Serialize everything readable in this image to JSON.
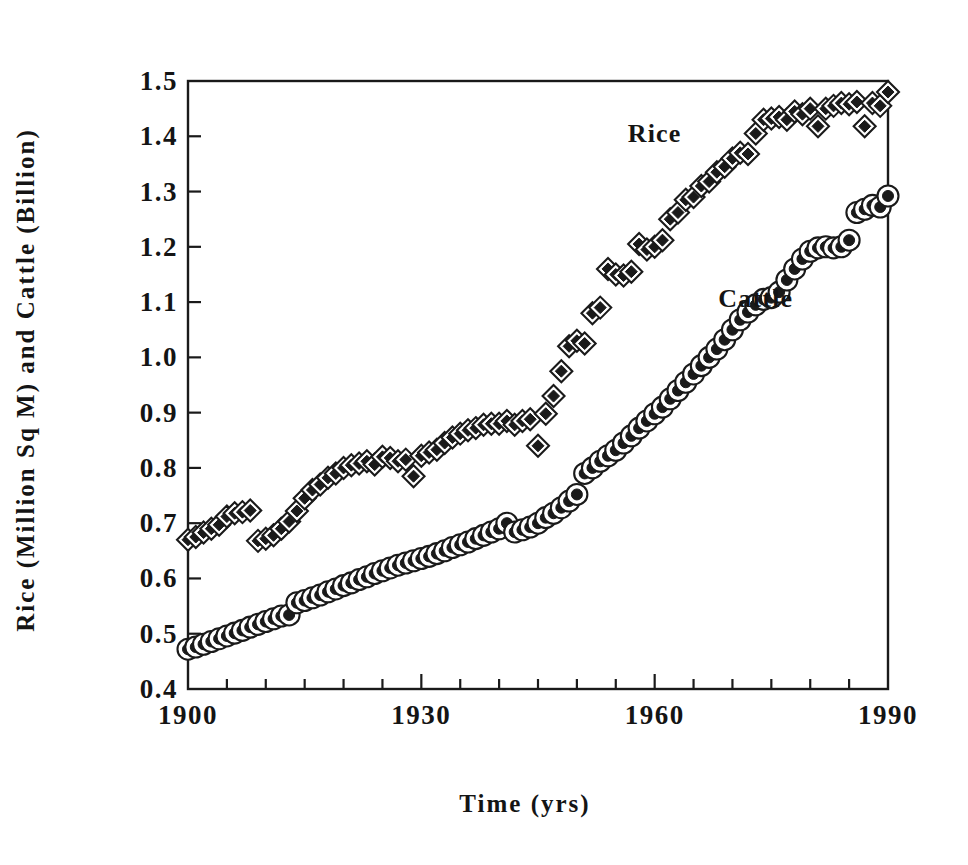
{
  "chart_data": {
    "type": "scatter",
    "title": "",
    "xlabel": "Time (yrs)",
    "ylabel": "Rice (Million Sq M) and Cattle (Billion)",
    "xlim": [
      1900,
      1990
    ],
    "ylim": [
      0.4,
      1.5
    ],
    "xticks": [
      1900,
      1930,
      1960,
      1990
    ],
    "xtick_labels": [
      "1900",
      "1930",
      "1960",
      "1990"
    ],
    "xminor_step": 5,
    "yticks": [
      0.4,
      0.5,
      0.6,
      0.7,
      0.8,
      0.9,
      1.0,
      1.1,
      1.2,
      1.3,
      1.4,
      1.5
    ],
    "ytick_labels": [
      "0.4",
      "0.5",
      "0.6",
      "0.7",
      "0.8",
      "0.9",
      "1.0",
      "1.1",
      "1.2",
      "1.3",
      "1.4",
      "1.5"
    ],
    "grid": false,
    "legend_position": "inline-annotation",
    "frame_color": "#1a1a1a",
    "marker_color": "#1a1a1a",
    "series": [
      {
        "name": "Rice",
        "marker": "diamond",
        "annotation_label": "Rice",
        "annotation_x": 1960,
        "annotation_y": 1.405,
        "x": [
          1900,
          1901,
          1902,
          1903,
          1904,
          1905,
          1906,
          1907,
          1908,
          1909,
          1910,
          1911,
          1912,
          1913,
          1914,
          1915,
          1916,
          1917,
          1918,
          1919,
          1920,
          1921,
          1922,
          1923,
          1924,
          1925,
          1926,
          1927,
          1928,
          1929,
          1930,
          1931,
          1932,
          1933,
          1934,
          1935,
          1936,
          1937,
          1938,
          1939,
          1940,
          1941,
          1942,
          1943,
          1944,
          1945,
          1946,
          1947,
          1948,
          1949,
          1950,
          1951,
          1952,
          1953,
          1954,
          1955,
          1956,
          1957,
          1958,
          1959,
          1960,
          1961,
          1962,
          1963,
          1964,
          1965,
          1966,
          1967,
          1968,
          1969,
          1970,
          1971,
          1972,
          1973,
          1974,
          1975,
          1976,
          1977,
          1978,
          1979,
          1980,
          1981,
          1982,
          1983,
          1984,
          1985,
          1986,
          1987,
          1988,
          1989,
          1990
        ],
        "y": [
          0.67,
          0.675,
          0.683,
          0.69,
          0.697,
          0.712,
          0.718,
          0.72,
          0.723,
          0.668,
          0.672,
          0.678,
          0.69,
          0.703,
          0.722,
          0.745,
          0.76,
          0.77,
          0.782,
          0.79,
          0.8,
          0.805,
          0.808,
          0.812,
          0.806,
          0.82,
          0.818,
          0.812,
          0.815,
          0.785,
          0.822,
          0.828,
          0.833,
          0.845,
          0.855,
          0.862,
          0.868,
          0.872,
          0.878,
          0.88,
          0.88,
          0.885,
          0.878,
          0.885,
          0.888,
          0.84,
          0.898,
          0.93,
          0.975,
          1.02,
          1.03,
          1.025,
          1.08,
          1.09,
          1.16,
          1.15,
          1.148,
          1.155,
          1.205,
          1.195,
          1.2,
          1.212,
          1.25,
          1.262,
          1.285,
          1.29,
          1.31,
          1.318,
          1.335,
          1.345,
          1.36,
          1.37,
          1.368,
          1.405,
          1.43,
          1.432,
          1.435,
          1.43,
          1.445,
          1.44,
          1.45,
          1.418,
          1.45,
          1.455,
          1.46,
          1.458,
          1.462,
          1.418,
          1.46,
          1.455,
          1.48
        ]
      },
      {
        "name": "Cattle",
        "marker": "circle",
        "annotation_label": "Cattle",
        "annotation_x": 1973,
        "annotation_y": 1.105,
        "x": [
          1900,
          1901,
          1902,
          1903,
          1904,
          1905,
          1906,
          1907,
          1908,
          1909,
          1910,
          1911,
          1912,
          1913,
          1914,
          1915,
          1916,
          1917,
          1918,
          1919,
          1920,
          1921,
          1922,
          1923,
          1924,
          1925,
          1926,
          1927,
          1928,
          1929,
          1930,
          1931,
          1932,
          1933,
          1934,
          1935,
          1936,
          1937,
          1938,
          1939,
          1940,
          1941,
          1942,
          1943,
          1944,
          1945,
          1946,
          1947,
          1948,
          1949,
          1950,
          1951,
          1952,
          1953,
          1954,
          1955,
          1956,
          1957,
          1958,
          1959,
          1960,
          1961,
          1962,
          1963,
          1964,
          1965,
          1966,
          1967,
          1968,
          1969,
          1970,
          1971,
          1972,
          1973,
          1974,
          1975,
          1976,
          1977,
          1978,
          1979,
          1980,
          1981,
          1982,
          1983,
          1984,
          1985,
          1986,
          1987,
          1988,
          1989,
          1990
        ],
        "y": [
          0.472,
          0.476,
          0.481,
          0.486,
          0.491,
          0.496,
          0.501,
          0.506,
          0.512,
          0.517,
          0.522,
          0.527,
          0.532,
          0.534,
          0.556,
          0.56,
          0.565,
          0.57,
          0.576,
          0.581,
          0.587,
          0.592,
          0.598,
          0.603,
          0.609,
          0.614,
          0.619,
          0.624,
          0.628,
          0.632,
          0.636,
          0.64,
          0.645,
          0.65,
          0.656,
          0.661,
          0.666,
          0.672,
          0.678,
          0.684,
          0.69,
          0.7,
          0.684,
          0.688,
          0.693,
          0.7,
          0.71,
          0.718,
          0.728,
          0.74,
          0.752,
          0.79,
          0.8,
          0.812,
          0.822,
          0.832,
          0.845,
          0.858,
          0.872,
          0.885,
          0.898,
          0.91,
          0.925,
          0.94,
          0.955,
          0.97,
          0.985,
          1.0,
          1.015,
          1.032,
          1.05,
          1.068,
          1.082,
          1.095,
          1.105,
          1.108,
          1.118,
          1.14,
          1.16,
          1.178,
          1.192,
          1.198,
          1.2,
          1.198,
          1.2,
          1.212,
          1.262,
          1.268,
          1.275,
          1.272,
          1.292
        ]
      }
    ]
  },
  "figure": {
    "background_color": "#ffffff",
    "axis_color": "#1a1a1a"
  }
}
